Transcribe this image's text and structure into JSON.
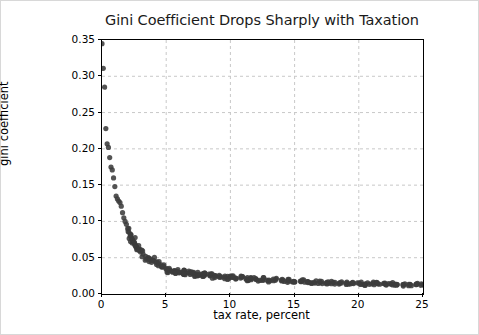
{
  "figure": {
    "width": 479,
    "height": 335,
    "background": "#ffffff",
    "border_color": "#d8d8d8"
  },
  "chart_data": {
    "type": "scatter",
    "title": "Gini Coefficient Drops Sharply with Taxation",
    "xlabel": "tax rate, percent",
    "ylabel": "gini coefficient",
    "xlim": [
      0,
      25
    ],
    "ylim": [
      0.0,
      0.35
    ],
    "xticks": [
      0,
      5,
      10,
      15,
      20,
      25
    ],
    "xtick_labels": [
      "0",
      "5",
      "10",
      "15",
      "20",
      "25"
    ],
    "yticks": [
      0.0,
      0.05,
      0.1,
      0.15,
      0.2,
      0.25,
      0.3,
      0.35
    ],
    "ytick_labels": [
      "0.00",
      "0.05",
      "0.10",
      "0.15",
      "0.20",
      "0.25",
      "0.30",
      "0.35"
    ],
    "grid": true,
    "grid_style": "dashed",
    "grid_color": "#c8c8c8",
    "legend": "none",
    "marker": {
      "shape": "circle",
      "color": "#3c3c3c",
      "size": 2.6
    },
    "x": [
      0.0,
      0.1,
      0.2,
      0.3,
      0.4,
      0.5,
      0.6,
      0.7,
      0.8,
      0.9,
      1.0,
      1.1,
      1.2,
      1.3,
      1.4,
      1.5,
      1.6,
      1.7,
      1.8,
      1.9,
      2.0,
      2.1,
      2.2,
      2.3,
      2.4,
      2.5,
      2.6,
      2.7,
      2.8,
      2.9,
      3.0,
      3.2,
      3.4,
      3.6,
      3.8,
      4.0,
      4.2,
      4.4,
      4.6,
      4.8,
      5.0,
      5.3,
      5.6,
      5.9,
      6.2,
      6.5,
      6.8,
      7.1,
      7.4,
      7.7,
      8.0,
      8.4,
      8.8,
      9.2,
      9.6,
      10.0,
      10.4,
      10.8,
      11.2,
      11.6,
      12.0,
      12.5,
      13.0,
      13.5,
      14.0,
      14.5,
      15.0,
      15.5,
      16.0,
      16.5,
      17.0,
      17.5,
      18.0,
      18.5,
      19.0,
      19.5,
      20.0,
      20.5,
      21.0,
      21.5,
      22.0,
      22.5,
      23.0,
      23.5,
      24.0,
      24.5,
      25.0
    ],
    "y": [
      0.345,
      0.311,
      0.285,
      0.228,
      0.207,
      0.202,
      0.188,
      0.175,
      0.171,
      0.16,
      0.148,
      0.135,
      0.131,
      0.128,
      0.126,
      0.121,
      0.112,
      0.105,
      0.1,
      0.096,
      0.09,
      0.085,
      0.08,
      0.077,
      0.074,
      0.071,
      0.068,
      0.065,
      0.062,
      0.06,
      0.058,
      0.055,
      0.052,
      0.05,
      0.048,
      0.046,
      0.044,
      0.042,
      0.04,
      0.038,
      0.034,
      0.033,
      0.032,
      0.031,
      0.03,
      0.029,
      0.029,
      0.028,
      0.027,
      0.027,
      0.026,
      0.025,
      0.025,
      0.024,
      0.023,
      0.023,
      0.022,
      0.022,
      0.021,
      0.021,
      0.02,
      0.02,
      0.019,
      0.019,
      0.018,
      0.018,
      0.017,
      0.017,
      0.017,
      0.016,
      0.016,
      0.016,
      0.016,
      0.015,
      0.015,
      0.015,
      0.015,
      0.014,
      0.014,
      0.014,
      0.014,
      0.014,
      0.013,
      0.013,
      0.013,
      0.013,
      0.013
    ]
  }
}
